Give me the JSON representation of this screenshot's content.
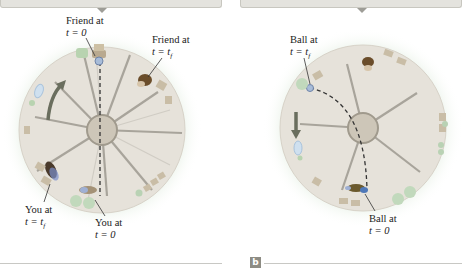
{
  "figure": {
    "colors": {
      "platform": "#e6e2da",
      "hub": "#cdc6b8",
      "ring_rim": "#bdb7ab",
      "glow": "#d9e8d6",
      "header_bar": "#e4e3de",
      "panel_letter_bg": "#8d8c84",
      "rotation_arrow": "#6a6e5e",
      "path": "#333333"
    }
  },
  "panel_a": {
    "letter": "a",
    "labels": {
      "friend_t0_line1": "Friend at",
      "friend_t0_line2": "t = 0",
      "friend_tf_line1": "Friend at",
      "friend_tf_line2": "t = t",
      "friend_tf_sub": "f",
      "you_tf_line1": "You at",
      "you_tf_line2": "t = t",
      "you_tf_sub": "f",
      "you_t0_line1": "You at",
      "you_t0_line2": "t = 0"
    },
    "rotation_direction": "counterclockwise-arrow",
    "ball_path": "straight-dashed-line"
  },
  "panel_b": {
    "letter": "b",
    "labels": {
      "ball_tf_line1": "Ball at",
      "ball_tf_line2": "t = t",
      "ball_tf_sub": "f",
      "ball_t0_line1": "Ball at",
      "ball_t0_line2": "t = 0"
    },
    "rotation_direction": "downward-arrow",
    "ball_path": "curved-dashed-line"
  }
}
